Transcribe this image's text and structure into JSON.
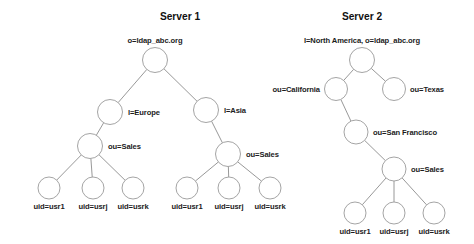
{
  "figure": {
    "background_color": "#ffffff",
    "line_color": "#8c8c8c",
    "node_fill": "#ffffff",
    "text_color": "#1c1c1c"
  },
  "panels": [
    {
      "id": "server-1",
      "title": "Server 1",
      "title_x": 180,
      "title_y": 20,
      "nodes": [
        {
          "id": "s1-root",
          "name": "root-node",
          "label": "o=ldap_abc.org",
          "cx": 155,
          "cy": 60,
          "r": 12.5,
          "label_x": 155,
          "label_y": 43,
          "anchor": "middle"
        },
        {
          "id": "s1-eu",
          "name": "l-europe-node",
          "label": "l=Europe",
          "cx": 110,
          "cy": 112,
          "r": 12.5,
          "label_x": 128,
          "label_y": 115,
          "anchor": "start"
        },
        {
          "id": "s1-asia",
          "name": "l-asia-node",
          "label": "l=Asia",
          "cx": 206,
          "cy": 110,
          "r": 12.5,
          "label_x": 224,
          "label_y": 113,
          "anchor": "start"
        },
        {
          "id": "s1-eu-sales",
          "name": "ou-sales-europe-node",
          "label": "ou=Sales",
          "cx": 90,
          "cy": 146,
          "r": 12.5,
          "label_x": 108,
          "label_y": 149,
          "anchor": "start"
        },
        {
          "id": "s1-asia-sales",
          "name": "ou-sales-asia-node",
          "label": "ou=Sales",
          "cx": 228,
          "cy": 154,
          "r": 12.5,
          "label_x": 246,
          "label_y": 157,
          "anchor": "start"
        },
        {
          "id": "s1-eu-u1",
          "name": "uid-usr1-node",
          "label": "uid=usr1",
          "cx": 49,
          "cy": 188,
          "r": 11,
          "label_x": 49,
          "label_y": 209,
          "anchor": "middle"
        },
        {
          "id": "s1-eu-u2",
          "name": "uid-usrj-node",
          "label": "uid=usrj",
          "cx": 93,
          "cy": 188,
          "r": 11,
          "label_x": 93,
          "label_y": 209,
          "anchor": "middle"
        },
        {
          "id": "s1-eu-u3",
          "name": "uid-usrk-node",
          "label": "uid=usrk",
          "cx": 133,
          "cy": 188,
          "r": 11,
          "label_x": 133,
          "label_y": 209,
          "anchor": "middle"
        },
        {
          "id": "s1-as-u1",
          "name": "uid-usr1-node",
          "label": "uid=usr1",
          "cx": 187,
          "cy": 188,
          "r": 11,
          "label_x": 187,
          "label_y": 209,
          "anchor": "middle"
        },
        {
          "id": "s1-as-u2",
          "name": "uid-usrj-node",
          "label": "uid=usrj",
          "cx": 229,
          "cy": 188,
          "r": 11,
          "label_x": 229,
          "label_y": 209,
          "anchor": "middle"
        },
        {
          "id": "s1-as-u3",
          "name": "uid-usrk-node",
          "label": "uid=usrk",
          "cx": 270,
          "cy": 188,
          "r": 11,
          "label_x": 270,
          "label_y": 209,
          "anchor": "middle"
        }
      ],
      "edges": [
        {
          "from": "s1-root",
          "to": "s1-eu"
        },
        {
          "from": "s1-root",
          "to": "s1-asia"
        },
        {
          "from": "s1-eu",
          "to": "s1-eu-sales"
        },
        {
          "from": "s1-asia",
          "to": "s1-asia-sales"
        },
        {
          "from": "s1-eu-sales",
          "to": "s1-eu-u1"
        },
        {
          "from": "s1-eu-sales",
          "to": "s1-eu-u2"
        },
        {
          "from": "s1-eu-sales",
          "to": "s1-eu-u3"
        },
        {
          "from": "s1-asia-sales",
          "to": "s1-as-u1"
        },
        {
          "from": "s1-asia-sales",
          "to": "s1-as-u2"
        },
        {
          "from": "s1-asia-sales",
          "to": "s1-as-u3"
        }
      ]
    },
    {
      "id": "server-2",
      "title": "Server 2",
      "title_x": 362,
      "title_y": 20,
      "nodes": [
        {
          "id": "s2-root",
          "name": "root-node",
          "label": "l=North America, o=ldap_abc.org",
          "cx": 362,
          "cy": 60,
          "r": 12.5,
          "label_x": 362,
          "label_y": 43,
          "anchor": "middle"
        },
        {
          "id": "s2-ca",
          "name": "ou-california-node",
          "label": "ou=California",
          "cx": 336,
          "cy": 89,
          "r": 11.5,
          "label_x": 320,
          "label_y": 92,
          "anchor": "end"
        },
        {
          "id": "s2-tx",
          "name": "ou-texas-node",
          "label": "ou=Texas",
          "cx": 394,
          "cy": 89,
          "r": 11.5,
          "label_x": 410,
          "label_y": 92,
          "anchor": "start"
        },
        {
          "id": "s2-sf",
          "name": "ou-san-francisco-node",
          "label": "ou=San Francisco",
          "cx": 356,
          "cy": 132,
          "r": 12,
          "label_x": 373,
          "label_y": 135,
          "anchor": "start"
        },
        {
          "id": "s2-sales",
          "name": "ou-sales-node",
          "label": "ou=Sales",
          "cx": 394,
          "cy": 169,
          "r": 12,
          "label_x": 411,
          "label_y": 172,
          "anchor": "start"
        },
        {
          "id": "s2-u1",
          "name": "uid-usr1-node",
          "label": "uid=usr1",
          "cx": 355,
          "cy": 213,
          "r": 11,
          "label_x": 355,
          "label_y": 234,
          "anchor": "middle"
        },
        {
          "id": "s2-u2",
          "name": "uid-usrj-node",
          "label": "uid=usrj",
          "cx": 394,
          "cy": 213,
          "r": 11,
          "label_x": 394,
          "label_y": 234,
          "anchor": "middle"
        },
        {
          "id": "s2-u3",
          "name": "uid-usrk-node",
          "label": "uid=usrk",
          "cx": 434,
          "cy": 213,
          "r": 11,
          "label_x": 434,
          "label_y": 234,
          "anchor": "middle"
        }
      ],
      "edges": [
        {
          "from": "s2-root",
          "to": "s2-ca"
        },
        {
          "from": "s2-root",
          "to": "s2-tx"
        },
        {
          "from": "s2-ca",
          "to": "s2-sf"
        },
        {
          "from": "s2-sf",
          "to": "s2-sales"
        },
        {
          "from": "s2-sales",
          "to": "s2-u1"
        },
        {
          "from": "s2-sales",
          "to": "s2-u2"
        },
        {
          "from": "s2-sales",
          "to": "s2-u3"
        }
      ]
    }
  ]
}
